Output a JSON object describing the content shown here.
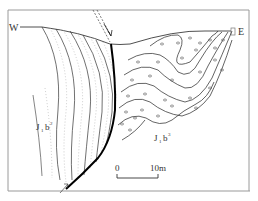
{
  "diagram": {
    "type": "geological-cross-section",
    "orientation": {
      "west_label": "W",
      "east_label": "E"
    },
    "units": [
      {
        "id": "left",
        "label_main": "J",
        "label_sub": "1",
        "label_b": "b",
        "label_sup": "2",
        "lithology": "sandstone (dotted hatch)"
      },
      {
        "id": "right",
        "label_main": "J",
        "label_sub": "1",
        "label_b": "b",
        "label_sup": "3",
        "lithology": "conglomerate (pebble symbols)"
      }
    ],
    "scale_bar": {
      "start_label": "0",
      "end_label": "10m"
    },
    "colors": {
      "line": "#222222",
      "frame": "#9a9a9a",
      "hatch": "#aaaaaa",
      "fault": "#000000"
    }
  }
}
